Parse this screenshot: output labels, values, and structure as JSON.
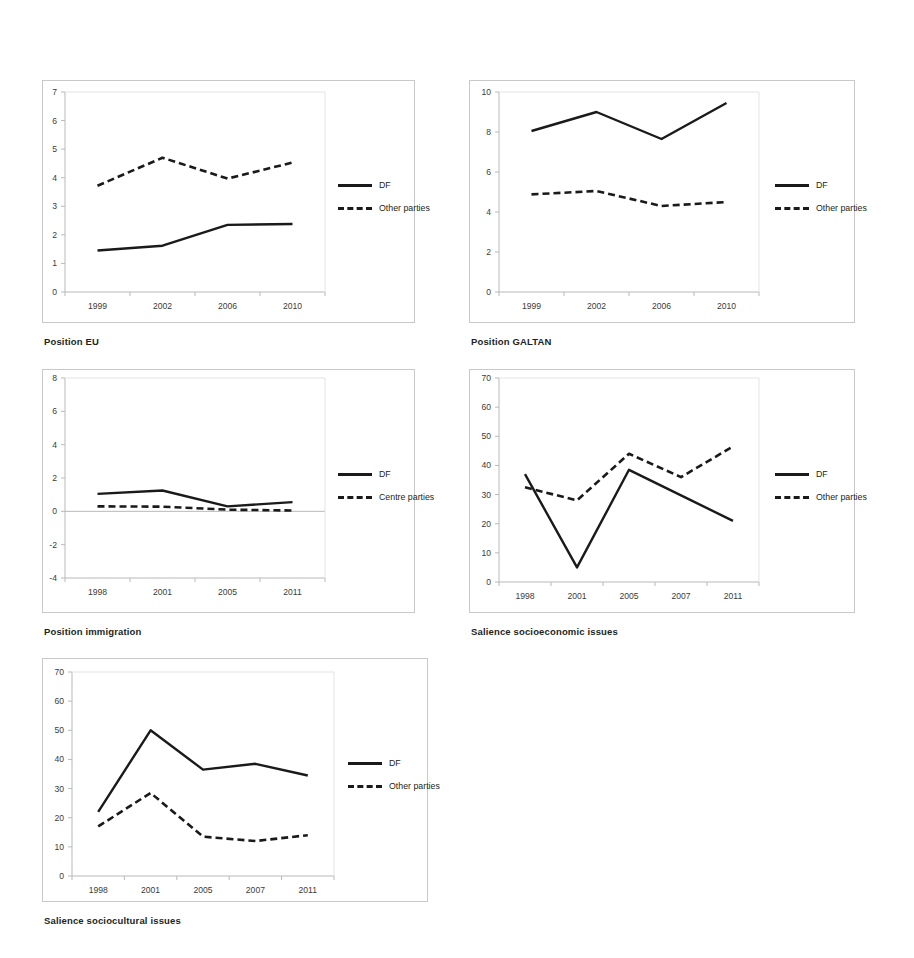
{
  "figure": {
    "background": "#ffffff",
    "series_colors": {
      "df": "#1a1a1a",
      "other": "#1a1a1a"
    }
  },
  "panels": [
    {
      "id": "position-eu",
      "caption": "Position EU",
      "legend": [
        {
          "label": "DF",
          "style": "solid"
        },
        {
          "label": "Other parties",
          "style": "dashed"
        }
      ],
      "chart": {
        "type": "line",
        "title": "Position EU",
        "xlabel": "",
        "ylabel": "",
        "categories": [
          "1999",
          "2002",
          "2006",
          "2010"
        ],
        "yticks": [
          0,
          1,
          2,
          3,
          4,
          5,
          6,
          7
        ],
        "ylim": [
          0,
          7
        ],
        "grid": false,
        "legend_position": "right",
        "series": [
          {
            "name": "DF",
            "style": "solid",
            "values": [
              1.45,
              1.62,
              2.35,
              2.38
            ]
          },
          {
            "name": "Other parties",
            "style": "dashed",
            "values": [
              3.72,
              4.7,
              3.97,
              4.53
            ]
          }
        ]
      }
    },
    {
      "id": "position-galtan",
      "caption": "Position GALTAN",
      "legend": [
        {
          "label": "DF",
          "style": "solid"
        },
        {
          "label": "Other parties",
          "style": "dashed"
        }
      ],
      "chart": {
        "type": "line",
        "title": "Position GALTAN",
        "xlabel": "",
        "ylabel": "",
        "categories": [
          "1999",
          "2002",
          "2006",
          "2010"
        ],
        "yticks": [
          0,
          2,
          4,
          6,
          8,
          10
        ],
        "ylim": [
          0,
          10
        ],
        "grid": false,
        "legend_position": "right",
        "series": [
          {
            "name": "DF",
            "style": "solid",
            "values": [
              8.05,
              9.0,
              7.65,
              9.45
            ]
          },
          {
            "name": "Other parties",
            "style": "dashed",
            "values": [
              4.88,
              5.05,
              4.3,
              4.5
            ]
          }
        ]
      }
    },
    {
      "id": "position-immigration",
      "caption": "Position immigration",
      "legend": [
        {
          "label": "DF",
          "style": "solid"
        },
        {
          "label": "Centre parties",
          "style": "dashed"
        }
      ],
      "chart": {
        "type": "line",
        "title": "Position immigration",
        "xlabel": "",
        "ylabel": "",
        "categories": [
          "1998",
          "2001",
          "2005",
          "2011"
        ],
        "yticks": [
          -4,
          -2,
          0,
          2,
          4,
          6,
          8
        ],
        "ylim": [
          -4,
          8
        ],
        "grid": false,
        "zero_line": true,
        "legend_position": "right",
        "series": [
          {
            "name": "DF",
            "style": "solid",
            "values": [
              1.05,
              1.25,
              0.3,
              0.55
            ]
          },
          {
            "name": "Centre parties",
            "style": "dashed",
            "values": [
              0.3,
              0.28,
              0.1,
              0.05
            ]
          }
        ]
      }
    },
    {
      "id": "salience-socioeconomic",
      "caption": "Salience socioeconomic issues",
      "legend": [
        {
          "label": "DF",
          "style": "solid"
        },
        {
          "label": "Other parties",
          "style": "dashed"
        }
      ],
      "chart": {
        "type": "line",
        "title": "Salience socioeconomic issues",
        "xlabel": "",
        "ylabel": "",
        "categories": [
          "1998",
          "2001",
          "2005",
          "2007",
          "2011"
        ],
        "yticks": [
          0,
          10,
          20,
          30,
          40,
          50,
          60,
          70
        ],
        "ylim": [
          0,
          70
        ],
        "grid": false,
        "legend_position": "right",
        "series": [
          {
            "name": "DF",
            "style": "solid",
            "values": [
              37,
              5,
              38.5,
              29.7,
              21
            ]
          },
          {
            "name": "Other parties",
            "style": "dashed",
            "values": [
              32.5,
              28,
              44,
              36,
              46.5
            ]
          }
        ]
      }
    },
    {
      "id": "salience-sociocultural",
      "caption": "Salience sociocultural issues",
      "legend": [
        {
          "label": "DF",
          "style": "solid"
        },
        {
          "label": "Other parties",
          "style": "dashed"
        }
      ],
      "chart": {
        "type": "line",
        "title": "Salience sociocultural issues",
        "xlabel": "",
        "ylabel": "",
        "categories": [
          "1998",
          "2001",
          "2005",
          "2007",
          "2011"
        ],
        "yticks": [
          0,
          10,
          20,
          30,
          40,
          50,
          60,
          70
        ],
        "ylim": [
          0,
          70
        ],
        "grid": false,
        "legend_position": "right",
        "series": [
          {
            "name": "DF",
            "style": "solid",
            "values": [
              22,
              50,
              36.5,
              38.5,
              34.5
            ]
          },
          {
            "name": "Other parties",
            "style": "dashed",
            "values": [
              17,
              28.5,
              13.5,
              12,
              14
            ]
          }
        ]
      }
    }
  ],
  "chart_data": [
    {
      "type": "line",
      "title": "Position EU",
      "categories": [
        "1999",
        "2002",
        "2006",
        "2010"
      ],
      "series": [
        {
          "name": "DF",
          "values": [
            1.45,
            1.62,
            2.35,
            2.38
          ]
        },
        {
          "name": "Other parties",
          "values": [
            3.72,
            4.7,
            3.97,
            4.53
          ]
        }
      ],
      "xlabel": "",
      "ylabel": "",
      "ylim": [
        0,
        7
      ],
      "grid": false,
      "legend_position": "right"
    },
    {
      "type": "line",
      "title": "Position GALTAN",
      "categories": [
        "1999",
        "2002",
        "2006",
        "2010"
      ],
      "series": [
        {
          "name": "DF",
          "values": [
            8.05,
            9.0,
            7.65,
            9.45
          ]
        },
        {
          "name": "Other parties",
          "values": [
            4.88,
            5.05,
            4.3,
            4.5
          ]
        }
      ],
      "xlabel": "",
      "ylabel": "",
      "ylim": [
        0,
        10
      ],
      "grid": false,
      "legend_position": "right"
    },
    {
      "type": "line",
      "title": "Position immigration",
      "categories": [
        "1998",
        "2001",
        "2005",
        "2011"
      ],
      "series": [
        {
          "name": "DF",
          "values": [
            1.05,
            1.25,
            0.3,
            0.55
          ]
        },
        {
          "name": "Centre parties",
          "values": [
            0.3,
            0.28,
            0.1,
            0.05
          ]
        }
      ],
      "xlabel": "",
      "ylabel": "",
      "ylim": [
        -4,
        8
      ],
      "grid": false,
      "legend_position": "right"
    },
    {
      "type": "line",
      "title": "Salience socioeconomic issues",
      "categories": [
        "1998",
        "2001",
        "2005",
        "2007",
        "2011"
      ],
      "series": [
        {
          "name": "DF",
          "values": [
            37,
            5,
            38.5,
            29.7,
            21
          ]
        },
        {
          "name": "Other parties",
          "values": [
            32.5,
            28,
            44,
            36,
            46.5
          ]
        }
      ],
      "xlabel": "",
      "ylabel": "",
      "ylim": [
        0,
        70
      ],
      "grid": false,
      "legend_position": "right"
    },
    {
      "type": "line",
      "title": "Salience sociocultural issues",
      "categories": [
        "1998",
        "2001",
        "2005",
        "2007",
        "2011"
      ],
      "series": [
        {
          "name": "DF",
          "values": [
            22,
            50,
            36.5,
            38.5,
            34.5
          ]
        },
        {
          "name": "Other parties",
          "values": [
            17,
            28.5,
            13.5,
            12,
            14
          ]
        }
      ],
      "xlabel": "",
      "ylabel": "",
      "ylim": [
        0,
        70
      ],
      "grid": false,
      "legend_position": "right"
    }
  ]
}
